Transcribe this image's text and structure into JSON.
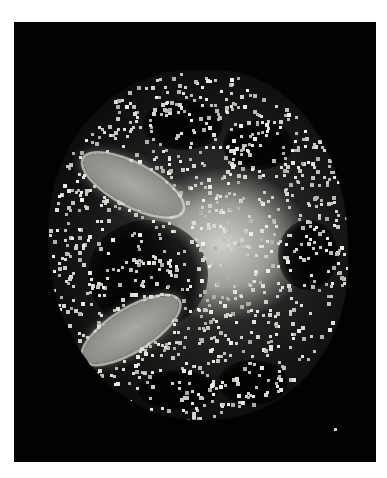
{
  "image": {
    "description": "Grayscale speckled cross-section image on black background within white margin",
    "colors": {
      "page_background": "#ffffff",
      "frame_background": "#020202",
      "speckle": "#d6d6d2",
      "lobe": "#a9a9a6",
      "center_glow": "#d7d7d2"
    },
    "speckle_seed": 1337,
    "speckle_count": 1400
  }
}
